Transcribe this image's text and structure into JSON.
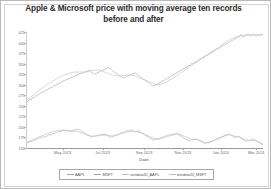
{
  "chart_data": {
    "type": "line",
    "title": "Apple & Microsoft price with moving average ten records before and after",
    "title_line1": "Apple & Microsoft price with moving average ten records",
    "title_line2": "before and after",
    "xlabel": "Date",
    "ylabel": "",
    "grid": false,
    "legend_position": "below-axes",
    "ylim": [
      150,
      425
    ],
    "yticks": [
      150,
      175,
      200,
      225,
      250,
      275,
      300,
      325,
      350,
      375,
      400,
      425
    ],
    "ytick_labels": [
      "150",
      "175",
      "200",
      "225",
      "250",
      "275",
      "300",
      "325",
      "350",
      "375",
      "400",
      "425"
    ],
    "xticks": [
      "May 2023",
      "Jul 2023",
      "Sep 2023",
      "Nov 2023",
      "Jan 2024",
      "Mar 2024"
    ],
    "xtick_positions_pct": [
      15.5,
      32.5,
      50.0,
      66.5,
      82.5,
      97.5
    ],
    "xlim": [
      "Apr 2023",
      "Mar 2024"
    ],
    "series": [
      {
        "name": "AAPL",
        "color": "#9aa5b1",
        "values": [
          163,
          162,
          164,
          165,
          166,
          165,
          167,
          169,
          168,
          170,
          172,
          171,
          173,
          175,
          174,
          176,
          175,
          177,
          176,
          178,
          177,
          179,
          181,
          180,
          182,
          181,
          183,
          185,
          184,
          186,
          188,
          187,
          189,
          188,
          190,
          189,
          191,
          193,
          192,
          191,
          193,
          192,
          190,
          191,
          189,
          190,
          192,
          191,
          193,
          192,
          194,
          193,
          195,
          194,
          193,
          191,
          190,
          188,
          187,
          186,
          184,
          183,
          181,
          180,
          179,
          177,
          176,
          178,
          177,
          179,
          178,
          180,
          179,
          181,
          180,
          182,
          181,
          183,
          182,
          181,
          183,
          182,
          180,
          179,
          178,
          176,
          175,
          177,
          176,
          178,
          180,
          179,
          181,
          183,
          182,
          184,
          186,
          185,
          187,
          186,
          188,
          190,
          189,
          191,
          190,
          192,
          191,
          193,
          192,
          191,
          189,
          188,
          190,
          189,
          191,
          190,
          188,
          187,
          185,
          184,
          182,
          181,
          179,
          178,
          176,
          175,
          173,
          172,
          171,
          170,
          169,
          171,
          170,
          172,
          171,
          173,
          172,
          174,
          176,
          175,
          177,
          176,
          178,
          180,
          179,
          181,
          180,
          182,
          181,
          183,
          182,
          184,
          183,
          185,
          184,
          183,
          181,
          180,
          178,
          177,
          175,
          174,
          172,
          171,
          170,
          168,
          167,
          169,
          168,
          170,
          169,
          171,
          170,
          172,
          171,
          170,
          168,
          167,
          165,
          164,
          163,
          161,
          160,
          162,
          161,
          163,
          162,
          164,
          166,
          165,
          167,
          169,
          168,
          170,
          172,
          171,
          173,
          175,
          174,
          176,
          178,
          177,
          179,
          181,
          180,
          182,
          181,
          183,
          182,
          181,
          179,
          178,
          176,
          175,
          177,
          176,
          178,
          177,
          176,
          174,
          173,
          171,
          170,
          169,
          167,
          166,
          168,
          167,
          169,
          168,
          170,
          169,
          171,
          170,
          169,
          167,
          166,
          164,
          163,
          161,
          160,
          158,
          157
        ]
      },
      {
        "name": "MSFT",
        "color": "#9aa5b1",
        "values": [
          262,
          260,
          264,
          266,
          263,
          268,
          270,
          269,
          272,
          274,
          273,
          276,
          278,
          277,
          280,
          282,
          281,
          284,
          283,
          286,
          288,
          287,
          290,
          292,
          291,
          294,
          293,
          296,
          298,
          297,
          300,
          302,
          301,
          304,
          303,
          306,
          308,
          307,
          310,
          309,
          312,
          311,
          314,
          313,
          316,
          315,
          318,
          317,
          320,
          319,
          322,
          321,
          324,
          323,
          326,
          325,
          327,
          326,
          329,
          328,
          331,
          330,
          333,
          332,
          335,
          334,
          331,
          329,
          328,
          326,
          325,
          327,
          326,
          329,
          328,
          331,
          333,
          332,
          335,
          334,
          337,
          336,
          339,
          338,
          341,
          340,
          338,
          336,
          335,
          333,
          332,
          330,
          328,
          327,
          325,
          324,
          322,
          320,
          319,
          317,
          316,
          318,
          317,
          319,
          321,
          320,
          322,
          324,
          323,
          325,
          327,
          326,
          328,
          327,
          325,
          323,
          322,
          320,
          318,
          317,
          315,
          313,
          312,
          310,
          308,
          307,
          305,
          303,
          302,
          300,
          298,
          297,
          299,
          298,
          300,
          302,
          301,
          304,
          306,
          305,
          308,
          310,
          309,
          312,
          314,
          313,
          316,
          318,
          317,
          320,
          322,
          321,
          324,
          326,
          325,
          328,
          330,
          329,
          332,
          334,
          333,
          336,
          338,
          337,
          340,
          342,
          341,
          344,
          346,
          345,
          348,
          350,
          349,
          352,
          354,
          353,
          356,
          358,
          357,
          360,
          362,
          361,
          364,
          366,
          365,
          368,
          370,
          369,
          372,
          374,
          373,
          376,
          378,
          377,
          380,
          382,
          381,
          384,
          386,
          385,
          388,
          390,
          389,
          392,
          394,
          393,
          396,
          398,
          397,
          400,
          402,
          401,
          404,
          406,
          405,
          408,
          410,
          409,
          412,
          414,
          413,
          416,
          418,
          417,
          415,
          413,
          416,
          418,
          417,
          420,
          419,
          417,
          416,
          418,
          417,
          419,
          418,
          416,
          415,
          417,
          416,
          418,
          417,
          419,
          418,
          420
        ]
      },
      {
        "name": "window20_AAPL",
        "color": "#b6bcc4",
        "values": [
          164,
          165,
          166,
          167,
          168,
          169,
          170,
          171,
          172,
          173,
          174,
          175,
          176,
          177,
          178,
          179,
          180,
          181,
          182,
          183,
          184,
          185,
          186,
          187,
          188,
          188,
          189,
          190,
          190,
          191,
          191,
          192,
          192,
          192,
          192,
          192,
          192,
          192,
          191,
          191,
          191,
          191,
          191,
          191,
          190,
          190,
          190,
          190,
          190,
          190,
          189,
          189,
          188,
          187,
          186,
          185,
          184,
          183,
          182,
          181,
          180,
          180,
          179,
          179,
          178,
          178,
          178,
          178,
          178,
          178,
          179,
          179,
          179,
          180,
          180,
          180,
          180,
          180,
          180,
          180,
          180,
          180,
          179,
          179,
          179,
          179,
          179,
          180,
          180,
          181,
          181,
          182,
          183,
          184,
          185,
          186,
          186,
          187,
          188,
          188,
          189,
          189,
          190,
          190,
          190,
          190,
          190,
          189,
          189,
          188,
          188,
          187,
          187,
          186,
          185,
          184,
          183,
          182,
          181,
          180,
          179,
          178,
          177,
          176,
          175,
          174,
          173,
          172,
          172,
          171,
          171,
          171,
          172,
          172,
          173,
          173,
          174,
          175,
          176,
          177,
          178,
          178,
          179,
          180,
          180,
          181,
          181,
          182,
          182,
          183,
          183,
          182,
          182,
          181,
          180,
          179,
          178,
          177,
          176,
          175,
          174,
          173,
          172,
          171,
          170,
          170,
          170,
          170,
          170,
          170,
          169,
          169,
          168,
          167,
          166,
          165,
          164,
          163,
          163,
          163,
          163,
          164,
          164,
          165,
          166,
          167,
          168,
          169,
          170,
          171,
          172,
          173,
          174,
          175,
          176,
          177,
          178,
          179,
          180,
          180,
          181,
          181,
          181,
          180,
          180,
          179,
          178,
          177,
          177,
          176,
          176,
          175,
          174,
          173,
          172,
          171,
          170,
          169,
          169,
          168,
          168,
          168,
          168,
          168,
          168,
          168,
          167,
          167,
          166,
          165,
          164,
          163,
          162,
          161,
          160
        ]
      },
      {
        "name": "window20_MSFT",
        "color": "#b6bcc4",
        "values": [
          264,
          266,
          268,
          270,
          272,
          274,
          276,
          278,
          280,
          282,
          284,
          286,
          288,
          290,
          292,
          294,
          295,
          297,
          299,
          301,
          302,
          304,
          306,
          307,
          309,
          310,
          312,
          313,
          315,
          316,
          318,
          319,
          320,
          321,
          322,
          323,
          324,
          325,
          326,
          327,
          328,
          328,
          329,
          329,
          330,
          330,
          330,
          330,
          330,
          330,
          330,
          330,
          330,
          330,
          330,
          331,
          331,
          332,
          332,
          333,
          333,
          334,
          334,
          335,
          335,
          335,
          335,
          334,
          334,
          333,
          332,
          331,
          330,
          329,
          328,
          327,
          326,
          325,
          324,
          323,
          323,
          322,
          322,
          321,
          321,
          321,
          321,
          321,
          321,
          322,
          322,
          322,
          323,
          323,
          323,
          323,
          323,
          322,
          322,
          321,
          320,
          319,
          318,
          317,
          316,
          315,
          314,
          313,
          312,
          311,
          310,
          309,
          308,
          307,
          306,
          305,
          304,
          303,
          302,
          301,
          300,
          300,
          300,
          300,
          301,
          302,
          303,
          304,
          305,
          307,
          308,
          310,
          311,
          313,
          314,
          316,
          318,
          319,
          321,
          323,
          324,
          326,
          328,
          330,
          331,
          333,
          335,
          337,
          338,
          340,
          342,
          344,
          345,
          347,
          349,
          351,
          352,
          354,
          356,
          358,
          359,
          361,
          363,
          365,
          366,
          368,
          370,
          372,
          373,
          375,
          377,
          379,
          380,
          382,
          384,
          386,
          387,
          389,
          391,
          393,
          394,
          396,
          398,
          400,
          401,
          403,
          405,
          406,
          408,
          409,
          410,
          411,
          412,
          413,
          414,
          415,
          415,
          416,
          416,
          416,
          417,
          417,
          417,
          417,
          418,
          418,
          418,
          418,
          418,
          418,
          419,
          419,
          419,
          419,
          419,
          419,
          419,
          419,
          419
        ]
      }
    ],
    "legend_entries": [
      {
        "label": "AAPL",
        "color": "#9aa5b1"
      },
      {
        "label": "MSFT",
        "color": "#9aa5b1"
      },
      {
        "label": "window20_AAPL",
        "color": "#b6bcc4"
      },
      {
        "label": "window20_MSFT",
        "color": "#b6bcc4"
      }
    ]
  }
}
